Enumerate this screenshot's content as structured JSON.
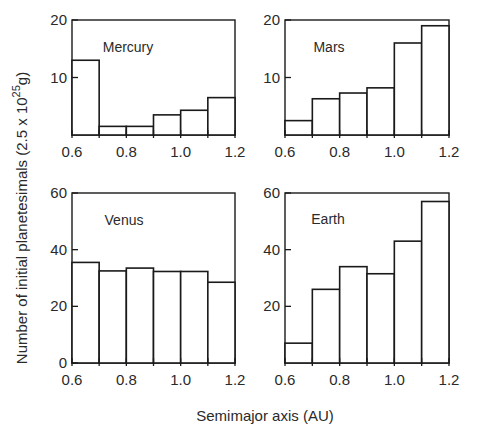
{
  "figure": {
    "xlabel": "Semimajor axis (AU)",
    "ylabel_main": "Number of initial planetesimals (2.5 x 10",
    "ylabel_exp": "25",
    "ylabel_tail": "g)"
  },
  "chart_data": [
    {
      "type": "bar",
      "title": "Mercury",
      "bin_edges": [
        0.6,
        0.7,
        0.8,
        0.9,
        1.0,
        1.1,
        1.2
      ],
      "categories": [
        "0.6-0.7",
        "0.7-0.8",
        "0.8-0.9",
        "0.9-1.0",
        "1.0-1.1",
        "1.1-1.2"
      ],
      "values": [
        13,
        1.5,
        1.5,
        3.5,
        4.3,
        6.5
      ],
      "xlabel": "Semimajor axis (AU)",
      "ylabel": "Number of initial planetesimals (2.5 x 10^25 g)",
      "xlim": [
        0.6,
        1.2
      ],
      "ylim": [
        0,
        20
      ],
      "xticks": [
        "0.6",
        "0.8",
        "1.0",
        "1.2"
      ],
      "yticks": [
        "10",
        "20"
      ],
      "grid": false,
      "legend": "none"
    },
    {
      "type": "bar",
      "title": "Mars",
      "bin_edges": [
        0.6,
        0.7,
        0.8,
        0.9,
        1.0,
        1.1,
        1.2
      ],
      "categories": [
        "0.6-0.7",
        "0.7-0.8",
        "0.8-0.9",
        "0.9-1.0",
        "1.0-1.1",
        "1.1-1.2"
      ],
      "values": [
        2.5,
        6.3,
        7.3,
        8.2,
        16,
        19
      ],
      "xlabel": "Semimajor axis (AU)",
      "ylabel": "Number of initial planetesimals (2.5 x 10^25 g)",
      "xlim": [
        0.6,
        1.2
      ],
      "ylim": [
        0,
        20
      ],
      "xticks": [
        "0.6",
        "0.8",
        "1.0",
        "1.2"
      ],
      "yticks": [
        "10",
        "20"
      ],
      "grid": false,
      "legend": "none"
    },
    {
      "type": "bar",
      "title": "Venus",
      "bin_edges": [
        0.6,
        0.7,
        0.8,
        0.9,
        1.0,
        1.1,
        1.2
      ],
      "categories": [
        "0.6-0.7",
        "0.7-0.8",
        "0.8-0.9",
        "0.9-1.0",
        "1.0-1.1",
        "1.1-1.2"
      ],
      "values": [
        35.5,
        32.5,
        33.5,
        32.3,
        32.3,
        28.5
      ],
      "xlabel": "Semimajor axis (AU)",
      "ylabel": "Number of initial planetesimals (2.5 x 10^25 g)",
      "xlim": [
        0.6,
        1.2
      ],
      "ylim": [
        0,
        60
      ],
      "xticks": [
        "0.6",
        "0.8",
        "1.0",
        "1.2"
      ],
      "yticks": [
        "0",
        "20",
        "40",
        "60"
      ],
      "grid": false,
      "legend": "none"
    },
    {
      "type": "bar",
      "title": "Earth",
      "bin_edges": [
        0.6,
        0.7,
        0.8,
        0.9,
        1.0,
        1.1,
        1.2
      ],
      "categories": [
        "0.6-0.7",
        "0.7-0.8",
        "0.8-0.9",
        "0.9-1.0",
        "1.0-1.1",
        "1.1-1.2"
      ],
      "values": [
        7,
        26,
        34,
        31.5,
        43,
        57
      ],
      "xlabel": "Semimajor axis (AU)",
      "ylabel": "Number of initial planetesimals (2.5 x 10^25 g)",
      "xlim": [
        0.6,
        1.2
      ],
      "ylim": [
        0,
        60
      ],
      "xticks": [
        "0.6",
        "0.8",
        "1.0",
        "1.2"
      ],
      "yticks": [
        "20",
        "40",
        "60"
      ],
      "grid": false,
      "legend": "none"
    }
  ]
}
